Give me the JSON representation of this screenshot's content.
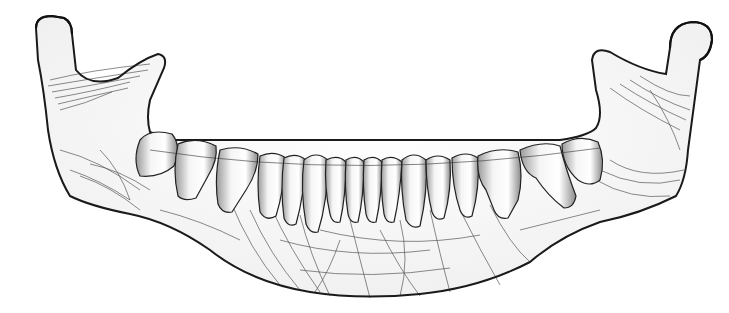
{
  "image": {
    "subject": "mandible-illustration",
    "description": "Grayscale rendering of a human lower jaw (mandible) with 16 teeth and trabecular line texture",
    "background": "#ffffff",
    "stroke_color": "#111111",
    "bone_fill": "#f7f7f7",
    "tooth_fill": "#f2f2f2",
    "tooth_count": 16
  }
}
